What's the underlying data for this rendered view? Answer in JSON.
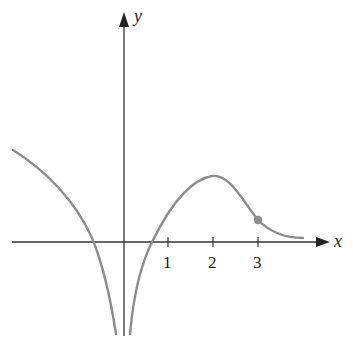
{
  "axes": {
    "x_label": "x",
    "y_label": "y",
    "x_ticks": [
      "1",
      "2",
      "3"
    ]
  },
  "colors": {
    "axis": "#333333",
    "curve": "#8c8c8c",
    "point": "#8c8c8c"
  },
  "graph": {
    "description": "Graph of a function with a vertical asymptote at x = 0, a local maximum at x = 2, an inflection point marked at x = 3, and a horizontal asymptote approaching y = 0 as x increases",
    "vertical_asymptote": "x = 0",
    "local_max": {
      "x": 2,
      "y": 1.47
    },
    "marked_point": {
      "x": 3,
      "y": 0.49
    },
    "x_intercepts_approx": [
      -0.67,
      0.67
    ]
  }
}
